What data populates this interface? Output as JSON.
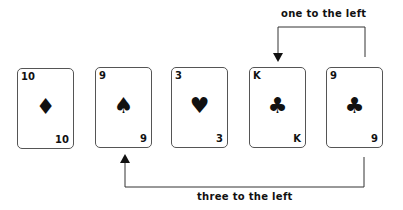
{
  "cards": [
    {
      "rank": "10",
      "suit": "diamond",
      "glyph": "♦"
    },
    {
      "rank": "9",
      "suit": "spade",
      "glyph": "♠"
    },
    {
      "rank": "3",
      "suit": "heart",
      "glyph": "♥"
    },
    {
      "rank": "K",
      "suit": "club",
      "glyph": "♣"
    },
    {
      "rank": "9",
      "suit": "club",
      "glyph": "♣"
    }
  ],
  "arrows": {
    "top": {
      "label": "one to the left",
      "from_card": 5,
      "to_card": 4
    },
    "bottom": {
      "label": "three to the left",
      "from_card": 5,
      "to_card": 2
    }
  }
}
